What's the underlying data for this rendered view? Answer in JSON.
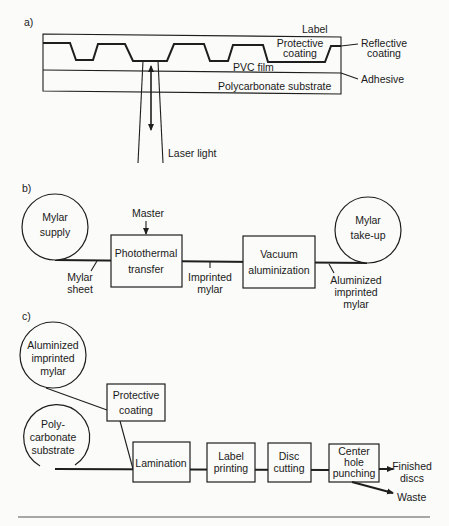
{
  "panel_a": {
    "tag": "a)",
    "labels": {
      "label": "Label",
      "protective_coating": [
        "Protective",
        "coating"
      ],
      "reflective_coating": [
        "Reflective",
        "coating"
      ],
      "pvc_film": "PVC film",
      "adhesive": "Adhesive",
      "polycarbonate_substrate": "Polycarbonate  substrate",
      "laser_light": "Laser light"
    }
  },
  "panel_b": {
    "tag": "b)",
    "mylar_supply": [
      "Mylar",
      "supply"
    ],
    "master": "Master",
    "photothermal_transfer": [
      "Photothermal",
      "transfer"
    ],
    "vacuum_aluminization": [
      "Vacuum",
      "aluminization"
    ],
    "mylar_takeup": [
      "Mylar",
      "take-up"
    ],
    "mylar_sheet": [
      "Mylar",
      "sheet"
    ],
    "imprinted_mylar": [
      "Imprinted",
      "mylar"
    ],
    "aluminized_imprinted_mylar": [
      "Aluminized",
      "imprinted",
      "mylar"
    ]
  },
  "panel_c": {
    "tag": "c)",
    "aluminized_imprinted_mylar": [
      "Aluminized",
      "imprinted",
      "mylar"
    ],
    "protective_coating": [
      "Protective",
      "coating"
    ],
    "polycarbonate_substrate": [
      "Poly-",
      "carbonate",
      "substrate"
    ],
    "lamination": "Lamination",
    "label_printing": [
      "Label",
      "printing"
    ],
    "disc_cutting": [
      "Disc",
      "cutting"
    ],
    "center_hole_punching": [
      "Center",
      "hole",
      "punching"
    ],
    "finished_discs": [
      "Finished",
      "discs"
    ],
    "waste": "Waste"
  }
}
